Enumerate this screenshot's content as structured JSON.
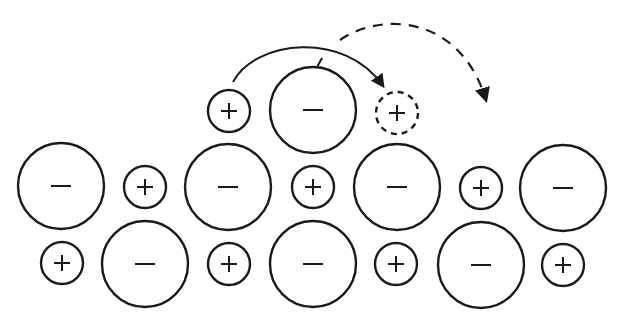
{
  "diagram": {
    "title": "",
    "colors": {
      "stroke": "#1a1a1a",
      "background": "#ffffff"
    },
    "anion_radius": 43,
    "cation_radius": 21,
    "ions": [
      {
        "type": "cation",
        "label": "+",
        "x": 229,
        "y": 111,
        "row": "top"
      },
      {
        "type": "anion",
        "label": "−",
        "x": 313,
        "y": 110,
        "row": "top"
      },
      {
        "type": "cation",
        "label": "+",
        "x": 397,
        "y": 113,
        "row": "top",
        "style": "dashed",
        "note": "vacancy destination"
      },
      {
        "type": "anion",
        "label": "−",
        "x": 61,
        "y": 186,
        "row": 1
      },
      {
        "type": "cation",
        "label": "+",
        "x": 145,
        "y": 187,
        "row": 1
      },
      {
        "type": "anion",
        "label": "−",
        "x": 228,
        "y": 187,
        "row": 1
      },
      {
        "type": "cation",
        "label": "+",
        "x": 313,
        "y": 187,
        "row": 1
      },
      {
        "type": "anion",
        "label": "−",
        "x": 397,
        "y": 187,
        "row": 1
      },
      {
        "type": "cation",
        "label": "+",
        "x": 481,
        "y": 188,
        "row": 1
      },
      {
        "type": "anion",
        "label": "−",
        "x": 563,
        "y": 188,
        "row": 1
      },
      {
        "type": "cation",
        "label": "+",
        "x": 62,
        "y": 263,
        "row": 2
      },
      {
        "type": "anion",
        "label": "−",
        "x": 145,
        "y": 264,
        "row": 2
      },
      {
        "type": "cation",
        "label": "+",
        "x": 229,
        "y": 264,
        "row": 2
      },
      {
        "type": "anion",
        "label": "−",
        "x": 313,
        "y": 264,
        "row": 2
      },
      {
        "type": "cation",
        "label": "+",
        "x": 396,
        "y": 264,
        "row": 2
      },
      {
        "type": "anion",
        "label": "−",
        "x": 481,
        "y": 265,
        "row": 2
      },
      {
        "type": "cation",
        "label": "+",
        "x": 563,
        "y": 265,
        "row": 2
      }
    ],
    "arrows": [
      {
        "name": "solid-hop-arrow",
        "style": "solid",
        "from": [
          233,
          82
        ],
        "to": [
          385,
          90
        ]
      },
      {
        "name": "dashed-hop-arrow",
        "style": "dashed",
        "from": [
          340,
          40
        ],
        "to": [
          488,
          105
        ]
      }
    ]
  }
}
